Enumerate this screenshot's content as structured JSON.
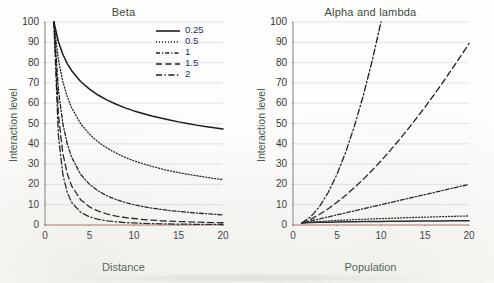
{
  "figure": {
    "background": "#fdfdfb",
    "axis_color": "#5a5a5a",
    "grid_color": "#d9dde4",
    "baseline_color": "#b06b60",
    "title_color": "#3d4a3d",
    "label_color": "#3d5a46"
  },
  "chart_data": [
    {
      "type": "line",
      "title": "Beta",
      "xlabel": "Distance",
      "ylabel": "Interaction level",
      "xlim": [
        0,
        20
      ],
      "ylim": [
        0,
        100
      ],
      "xticks": [
        0,
        5,
        10,
        15,
        20
      ],
      "yticks": [
        0,
        10,
        20,
        30,
        40,
        50,
        60,
        70,
        80,
        90,
        100
      ],
      "grid": "horizontal",
      "legend_position": "top-right",
      "legend_title": "",
      "x": [
        1,
        1.5,
        2,
        2.5,
        3,
        4,
        5,
        6,
        7,
        8,
        9,
        10,
        11,
        12,
        13,
        14,
        15,
        16,
        17,
        18,
        19,
        20
      ],
      "series": [
        {
          "name": "0.25",
          "style": "solid",
          "color": "#1b1b1b",
          "values": [
            100,
            90.4,
            84.1,
            79.5,
            76.0,
            70.7,
            66.9,
            63.9,
            61.5,
            59.5,
            57.7,
            56.2,
            54.9,
            53.7,
            52.7,
            51.7,
            50.8,
            50.0,
            49.2,
            48.5,
            47.9,
            47.3
          ]
        },
        {
          "name": "0.5",
          "style": "dotted",
          "color": "#1b1b1b",
          "values": [
            100,
            81.6,
            70.7,
            63.2,
            57.7,
            50.0,
            44.7,
            40.8,
            37.8,
            35.4,
            33.3,
            31.6,
            30.2,
            28.9,
            27.7,
            26.7,
            25.8,
            25.0,
            24.3,
            23.6,
            22.9,
            22.4
          ]
        },
        {
          "name": "1",
          "style": "dash-dot-short",
          "color": "#1b1b1b",
          "values": [
            100,
            66.7,
            50.0,
            40.0,
            33.3,
            25.0,
            20.0,
            16.7,
            14.3,
            12.5,
            11.1,
            10.0,
            9.1,
            8.3,
            7.7,
            7.1,
            6.7,
            6.3,
            5.9,
            5.6,
            5.3,
            5.0
          ]
        },
        {
          "name": "1.5",
          "style": "dashed",
          "color": "#1b1b1b",
          "values": [
            100,
            54.4,
            35.4,
            25.3,
            19.2,
            12.5,
            8.9,
            6.8,
            5.4,
            4.4,
            3.7,
            3.2,
            2.7,
            2.4,
            2.1,
            1.9,
            1.7,
            1.6,
            1.4,
            1.3,
            1.2,
            1.1
          ]
        },
        {
          "name": "2",
          "style": "dash-dot",
          "color": "#1b1b1b",
          "values": [
            100,
            44.4,
            25.0,
            16.0,
            11.1,
            6.3,
            4.0,
            2.8,
            2.0,
            1.6,
            1.2,
            1.0,
            0.8,
            0.7,
            0.6,
            0.5,
            0.4,
            0.4,
            0.3,
            0.3,
            0.3,
            0.25
          ]
        }
      ]
    },
    {
      "type": "line",
      "title": "Alpha and lambda",
      "xlabel": "Population",
      "ylabel": "Interaction level",
      "xlim": [
        0,
        20
      ],
      "ylim": [
        0,
        100
      ],
      "xticks": [
        0,
        5,
        10,
        15,
        20
      ],
      "yticks": [
        0,
        10,
        20,
        30,
        40,
        50,
        60,
        70,
        80,
        90,
        100
      ],
      "grid": "horizontal",
      "legend_position": "none",
      "x": [
        1,
        2,
        3,
        4,
        5,
        6,
        7,
        8,
        9,
        10,
        11,
        12,
        13,
        14,
        15,
        16,
        17,
        18,
        19,
        20
      ],
      "series": [
        {
          "name": "2",
          "style": "dash-dot",
          "color": "#1b1b1b",
          "values": [
            1,
            4,
            9,
            16,
            25,
            36,
            49,
            64,
            81,
            100
          ]
        },
        {
          "name": "1.5",
          "style": "dashed",
          "color": "#1b1b1b",
          "values": [
            1,
            2.8,
            5.2,
            8.0,
            11.2,
            14.7,
            18.5,
            22.6,
            27.0,
            31.6,
            36.5,
            41.6,
            46.9,
            52.4,
            58.1,
            64.0,
            70.1,
            76.4,
            82.8,
            89.4
          ]
        },
        {
          "name": "1",
          "style": "dash-dot-short",
          "color": "#1b1b1b",
          "values": [
            1,
            2,
            3,
            4,
            5,
            6,
            7,
            8,
            9,
            10,
            11,
            12,
            13,
            14,
            15,
            16,
            17,
            18,
            19,
            20
          ]
        },
        {
          "name": "0.5",
          "style": "dotted",
          "color": "#1b1b1b",
          "values": [
            1,
            1.41,
            1.73,
            2.0,
            2.24,
            2.45,
            2.65,
            2.83,
            3.0,
            3.16,
            3.32,
            3.46,
            3.61,
            3.74,
            3.87,
            4.0,
            4.12,
            4.24,
            4.36,
            4.47
          ]
        },
        {
          "name": "0.25",
          "style": "solid",
          "color": "#1b1b1b",
          "values": [
            1,
            1.19,
            1.32,
            1.41,
            1.5,
            1.57,
            1.63,
            1.68,
            1.73,
            1.78,
            1.82,
            1.86,
            1.9,
            1.93,
            1.97,
            2.0,
            2.03,
            2.06,
            2.09,
            2.11
          ]
        }
      ]
    }
  ],
  "legend": {
    "items": [
      {
        "label": "0.25",
        "style": "solid"
      },
      {
        "label": "0.5",
        "style": "dotted"
      },
      {
        "label": "1",
        "style": "dash-dot-short"
      },
      {
        "label": "1.5",
        "style": "dashed"
      },
      {
        "label": "2",
        "style": "dash-dot"
      }
    ]
  }
}
